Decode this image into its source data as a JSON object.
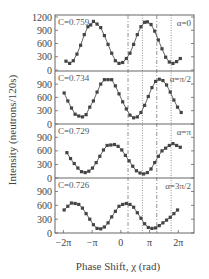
{
  "chart_data": {
    "type": "line",
    "title": "",
    "xlabel": "Phase Shift, χ (rad)",
    "ylabel": "Intensity (neutrons/120s)",
    "x_ticks": [
      "−2π",
      "−π",
      "0",
      "π",
      "2π"
    ],
    "x_tick_values": [
      -6.283,
      -3.1416,
      0,
      3.1416,
      6.283
    ],
    "xlim": [
      -7.2,
      8.0
    ],
    "grid": false,
    "vertical_lines": [
      {
        "x": 0.785,
        "style": "dash-dot"
      },
      {
        "x": 2.356,
        "style": "dotted"
      },
      {
        "x": 3.927,
        "style": "dash-dot"
      },
      {
        "x": 5.498,
        "style": "dotted"
      }
    ],
    "panels": [
      {
        "alpha_label": "α=0",
        "contrast_label": "C=0.759",
        "y_ticks": [
          "0",
          "300",
          "600",
          "900",
          "1200"
        ],
        "ylim": [
          0,
          1200
        ],
        "x": [
          -6.0,
          -5.6,
          -5.2,
          -4.8,
          -4.4,
          -4.0,
          -3.6,
          -3.3,
          -3.0,
          -2.6,
          -2.2,
          -1.8,
          -1.4,
          -1.0,
          -0.6,
          -0.2,
          0.2,
          0.6,
          1.0,
          1.4,
          1.8,
          2.2,
          2.6,
          2.9,
          3.3,
          3.7,
          4.1,
          4.5,
          4.9,
          5.3,
          5.7,
          6.1,
          6.5
        ],
        "values": [
          200,
          150,
          210,
          360,
          560,
          800,
          980,
          1020,
          1100,
          1040,
          960,
          780,
          580,
          380,
          210,
          150,
          170,
          260,
          380,
          580,
          800,
          980,
          1080,
          1090,
          1030,
          880,
          680,
          480,
          290,
          180,
          150,
          190,
          260
        ]
      },
      {
        "alpha_label": "α=π/2",
        "contrast_label": "C=0.734",
        "y_ticks": [
          "0",
          "300",
          "600",
          "900"
        ],
        "ylim": [
          0,
          1150
        ],
        "x": [
          -6.2,
          -5.8,
          -5.4,
          -5.0,
          -4.6,
          -4.2,
          -3.8,
          -3.4,
          -3.0,
          -2.6,
          -2.2,
          -1.8,
          -1.4,
          -1.0,
          -0.6,
          -0.2,
          0.2,
          0.6,
          1.0,
          1.4,
          1.8,
          2.2,
          2.6,
          3.0,
          3.4,
          3.8,
          4.2,
          4.6,
          5.0,
          5.4,
          5.8,
          6.2,
          6.6
        ],
        "values": [
          700,
          520,
          360,
          220,
          180,
          160,
          210,
          380,
          520,
          720,
          900,
          1000,
          1000,
          1000,
          860,
          680,
          500,
          340,
          200,
          140,
          160,
          260,
          420,
          620,
          820,
          960,
          1010,
          980,
          880,
          720,
          540,
          380,
          260
        ]
      },
      {
        "alpha_label": "α=π",
        "contrast_label": "C=0.729",
        "y_ticks": [
          "0",
          "300",
          "600",
          "900"
        ],
        "ylim": [
          0,
          1150
        ],
        "x": [
          -5.9,
          -5.5,
          -5.1,
          -4.7,
          -4.3,
          -3.9,
          -3.5,
          -3.1,
          -2.7,
          -2.3,
          -1.9,
          -1.5,
          -1.1,
          -0.7,
          -0.3,
          0.1,
          0.5,
          0.9,
          1.3,
          1.7,
          2.1,
          2.5,
          2.9,
          3.3,
          3.7,
          4.1,
          4.5,
          4.9,
          5.3,
          5.7,
          6.1,
          6.5
        ],
        "values": [
          560,
          430,
          320,
          220,
          140,
          120,
          150,
          220,
          340,
          480,
          620,
          720,
          730,
          740,
          700,
          620,
          500,
          380,
          260,
          160,
          110,
          90,
          120,
          200,
          340,
          480,
          600,
          660,
          720,
          760,
          720,
          680
        ]
      },
      {
        "alpha_label": "α=3π/2",
        "contrast_label": "C=0.726",
        "y_ticks": [
          "0",
          "300",
          "600",
          "900"
        ],
        "ylim": [
          0,
          1150
        ],
        "x": [
          -6.2,
          -5.8,
          -5.4,
          -5.0,
          -4.6,
          -4.2,
          -3.8,
          -3.4,
          -3.0,
          -2.6,
          -2.2,
          -1.8,
          -1.4,
          -1.0,
          -0.6,
          -0.2,
          0.2,
          0.6,
          1.0,
          1.4,
          1.8,
          2.2,
          2.6,
          3.0,
          3.4,
          3.8,
          4.2,
          4.6,
          5.0,
          5.4,
          5.8,
          6.2
        ],
        "values": [
          500,
          580,
          650,
          640,
          620,
          540,
          420,
          300,
          180,
          100,
          90,
          130,
          220,
          350,
          470,
          580,
          620,
          640,
          620,
          560,
          440,
          320,
          200,
          120,
          100,
          110,
          160,
          220,
          280,
          340,
          420,
          500
        ]
      }
    ]
  }
}
